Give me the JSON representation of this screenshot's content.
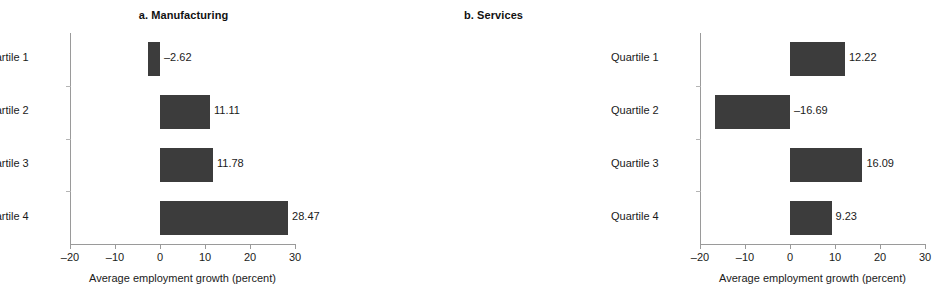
{
  "chart_data": [
    {
      "type": "bar",
      "orientation": "horizontal",
      "panel_id": "a",
      "title": "a. Manufacturing",
      "categories": [
        "Quartile 1",
        "Quartile 2",
        "Quartile 3",
        "Quartile 4"
      ],
      "values": [
        -2.62,
        11.11,
        11.78,
        28.47
      ],
      "value_labels": [
        "–2.62",
        "11.11",
        "11.78",
        "28.47"
      ],
      "xlabel": "Average employment growth (percent)",
      "ylabel": "",
      "xlim": [
        -20,
        30
      ],
      "xticks": [
        -20,
        -10,
        0,
        10,
        20,
        30
      ],
      "xticklabels": [
        "–20",
        "–10",
        "0",
        "10",
        "20",
        "30"
      ],
      "grid": false,
      "legend": false,
      "bar_color": "#3c3c3c"
    },
    {
      "type": "bar",
      "orientation": "horizontal",
      "panel_id": "b",
      "title": "b. Services",
      "categories": [
        "Quartile 1",
        "Quartile 2",
        "Quartile 3",
        "Quartile 4"
      ],
      "values": [
        12.22,
        -16.69,
        16.09,
        9.23
      ],
      "value_labels": [
        "12.22",
        "–16.69",
        "16.09",
        "9.23"
      ],
      "xlabel": "Average employment growth (percent)",
      "ylabel": "",
      "xlim": [
        -20,
        30
      ],
      "xticks": [
        -20,
        -10,
        0,
        10,
        20,
        30
      ],
      "xticklabels": [
        "–20",
        "–10",
        "0",
        "10",
        "20",
        "30"
      ],
      "grid": false,
      "legend": false,
      "bar_color": "#3c3c3c"
    }
  ]
}
